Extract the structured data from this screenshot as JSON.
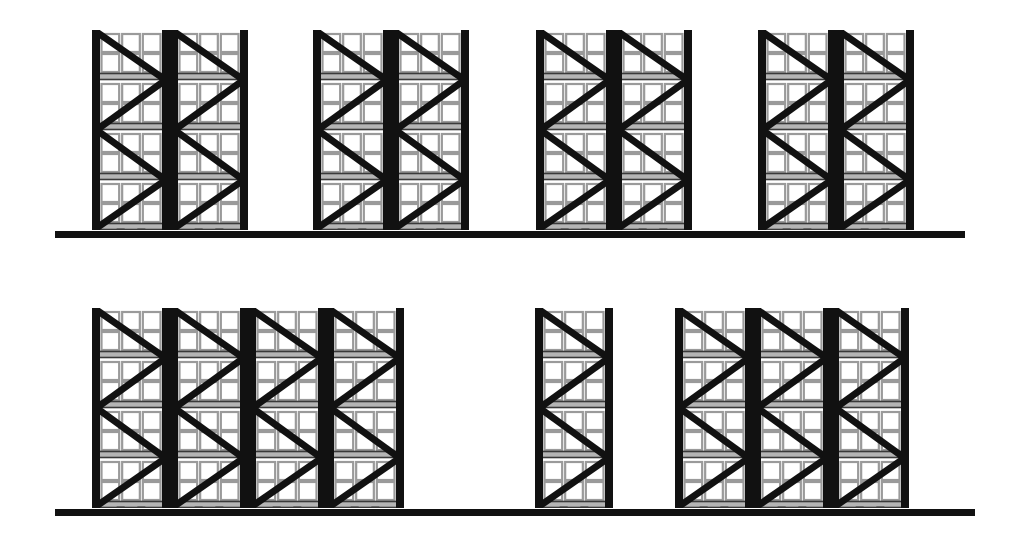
{
  "drawing": {
    "title": "Pallet Racking Elevation",
    "type": "technical-elevation-drawing",
    "subject": "warehouse selective pallet rack runs",
    "view": "front elevation",
    "background_color": "#ffffff",
    "line_color": "#111111",
    "beam_fill_color": "#b5b5b5",
    "beam_edge_color": "#3a3a3a",
    "cell_outline_color": "#9a9a9a",
    "canvas": {
      "width": 1015,
      "height": 537
    }
  },
  "bay_spec": {
    "levels": 4,
    "cells_per_level_across": 3,
    "cells_per_level_down": 2,
    "upright_width_px": 8,
    "bay_width_px": 78,
    "bay_height_px": 200,
    "brace_pattern": "zigzag-diagonal",
    "brace_stroke_px": 7
  },
  "rows": [
    {
      "name": "upper-rack-run",
      "label": "Upper rack run",
      "top": 30,
      "bay_height": 200,
      "ground": {
        "x": 55,
        "y": 231,
        "width": 910,
        "height": 7
      },
      "groups": [
        {
          "name": "group-a",
          "x": 92,
          "bays": 2
        },
        {
          "name": "group-b",
          "x": 313,
          "bays": 2
        },
        {
          "name": "group-c",
          "x": 536,
          "bays": 2
        },
        {
          "name": "group-d",
          "x": 758,
          "bays": 2
        }
      ]
    },
    {
      "name": "lower-rack-run",
      "label": "Lower rack run",
      "top": 308,
      "bay_height": 200,
      "ground": {
        "x": 55,
        "y": 509,
        "width": 920,
        "height": 7
      },
      "groups": [
        {
          "name": "group-e",
          "x": 92,
          "bays": 4
        },
        {
          "name": "group-f",
          "x": 535,
          "bays": 1
        },
        {
          "name": "group-g",
          "x": 675,
          "bays": 3
        }
      ]
    }
  ],
  "counts": {
    "total_bays": 16,
    "upper_row_bays": 8,
    "lower_row_bays": 8,
    "groups_upper": 4,
    "groups_lower": 3
  }
}
